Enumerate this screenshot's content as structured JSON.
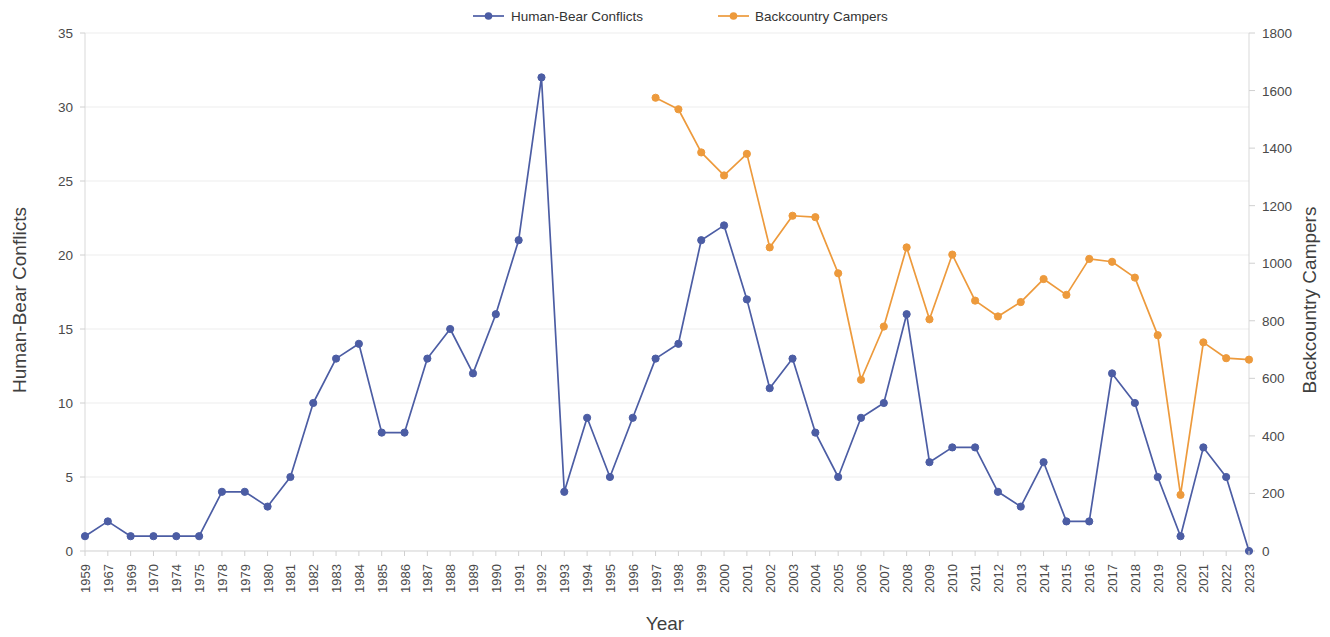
{
  "chart_data": {
    "type": "line",
    "title": "",
    "xlabel": "Year",
    "ylabel": "Human-Bear Conflicts",
    "y2label": "Backcountry Campers",
    "grid": false,
    "legend_position": "top-center",
    "categories": [
      "1959",
      "1967",
      "1969",
      "1970",
      "1974",
      "1975",
      "1978",
      "1979",
      "1980",
      "1981",
      "1982",
      "1983",
      "1984",
      "1985",
      "1986",
      "1987",
      "1988",
      "1989",
      "1990",
      "1991",
      "1992",
      "1993",
      "1994",
      "1995",
      "1996",
      "1997",
      "1998",
      "1999",
      "2000",
      "2001",
      "2002",
      "2003",
      "2004",
      "2005",
      "2006",
      "2007",
      "2008",
      "2009",
      "2010",
      "2011",
      "2012",
      "2013",
      "2014",
      "2015",
      "2016",
      "2017",
      "2018",
      "2019",
      "2020",
      "2021",
      "2022",
      "2023"
    ],
    "ylim": [
      0,
      35
    ],
    "yticks": [
      0,
      5,
      10,
      15,
      20,
      25,
      30,
      35
    ],
    "y2lim": [
      0,
      1800
    ],
    "y2ticks": [
      0,
      200,
      400,
      600,
      800,
      1000,
      1200,
      1400,
      1600,
      1800
    ],
    "series": [
      {
        "name": "Human-Bear Conflicts",
        "axis": "left",
        "color": "#4c5da4",
        "values": [
          1,
          2,
          1,
          1,
          1,
          1,
          4,
          4,
          3,
          5,
          10,
          13,
          14,
          8,
          8,
          13,
          15,
          12,
          16,
          21,
          32,
          4,
          9,
          5,
          9,
          13,
          14,
          21,
          22,
          17,
          11,
          13,
          8,
          5,
          9,
          10,
          16,
          6,
          7,
          7,
          4,
          3,
          6,
          2,
          2,
          12,
          10,
          5,
          1,
          7,
          5,
          0
        ]
      },
      {
        "name": "Backcountry Campers",
        "axis": "right",
        "color": "#ed9a3c",
        "values": [
          null,
          null,
          null,
          null,
          null,
          null,
          null,
          null,
          null,
          null,
          null,
          null,
          null,
          null,
          null,
          null,
          null,
          null,
          null,
          null,
          null,
          null,
          null,
          null,
          null,
          1575,
          1535,
          1385,
          1305,
          1380,
          1055,
          1165,
          1160,
          965,
          595,
          780,
          1055,
          805,
          1030,
          870,
          815,
          865,
          945,
          890,
          1015,
          1005,
          950,
          750,
          195,
          725,
          670,
          665
        ]
      }
    ]
  },
  "legend": {
    "items": [
      {
        "label": "Human-Bear Conflicts",
        "color": "#4c5da4"
      },
      {
        "label": "Backcountry Campers",
        "color": "#ed9a3c"
      }
    ]
  }
}
